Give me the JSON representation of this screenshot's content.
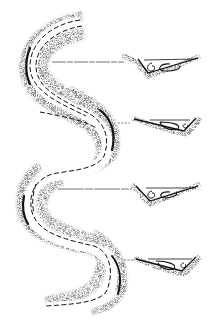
{
  "figure": {
    "colors": {
      "background": "#ffffff",
      "ink": "#111111",
      "stipple": "#555555"
    },
    "cross_sections": [
      {
        "id": "section-1",
        "y": 67,
        "asymmetry": "deep-left",
        "flow": "clockwise-cell-left"
      },
      {
        "id": "section-2",
        "y": 125,
        "asymmetry": "deep-right",
        "flow": "cell-right"
      },
      {
        "id": "section-3",
        "y": 188,
        "asymmetry": "deep-left",
        "flow": "clockwise-cell-left"
      },
      {
        "id": "section-4",
        "y": 262,
        "asymmetry": "deep-right",
        "flow": "cell-right"
      }
    ]
  }
}
